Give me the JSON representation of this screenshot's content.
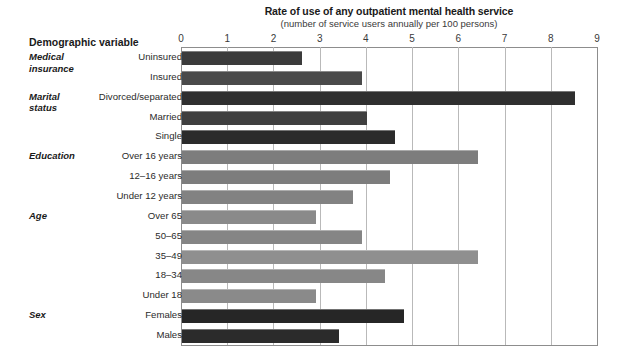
{
  "header": {
    "left_column_title": "Demographic variable",
    "chart_title": "Rate of use of any outpatient mental health service",
    "chart_subtitle": "(number of service users annually per 100 persons)"
  },
  "colors": {
    "bar_dark": "#3b3b3b",
    "bar_medium": "#7d7d7d",
    "gridline": "#b9b9b9",
    "axis": "#8d8d8d",
    "text": "#231f20"
  },
  "groups": [
    {
      "name": "Medical\ninsurance"
    },
    {
      "name": "Marital\nstatus"
    },
    {
      "name": "Education"
    },
    {
      "name": "Age"
    },
    {
      "name": "Sex"
    }
  ],
  "chart_data": {
    "type": "bar",
    "orientation": "horizontal",
    "title": "Rate of use of any outpatient mental health service",
    "subtitle": "(number of service users annually per 100 persons)",
    "xlabel": "(number of service users annually per 100 persons)",
    "ylabel": "Demographic variable",
    "xlim": [
      0,
      9
    ],
    "xticks": [
      0,
      1,
      2,
      3,
      4,
      5,
      6,
      7,
      8,
      9
    ],
    "xticklabels": [
      "0",
      "1",
      "2",
      "3",
      "4",
      "5",
      "6",
      "7",
      "8",
      "9"
    ],
    "grid": true,
    "legend": "none",
    "categories": [
      "Uninsured",
      "Insured",
      "Divorced/separated",
      "Married",
      "Single",
      "Over 16 years",
      "12–16 years",
      "Under 12 years",
      "Over 65",
      "50–65",
      "35–49",
      "18–34",
      "Under 18",
      "Females",
      "Males"
    ],
    "values": [
      2.6,
      3.9,
      8.5,
      4.0,
      4.6,
      6.4,
      4.5,
      3.7,
      2.9,
      3.9,
      6.4,
      4.4,
      2.9,
      4.8,
      3.4
    ],
    "group_of_category": [
      "Medical insurance",
      "Medical insurance",
      "Marital status",
      "Marital status",
      "Marital status",
      "Education",
      "Education",
      "Education",
      "Age",
      "Age",
      "Age",
      "Age",
      "Age",
      "Sex",
      "Sex"
    ],
    "bar_colors": [
      "#3b3b3b",
      "#4a4a4a",
      "#2f2f2f",
      "#3f3f3f",
      "#2b2b2b",
      "#7d7d7d",
      "#7d7d7d",
      "#828282",
      "#8a8a8a",
      "#858585",
      "#8f8f8f",
      "#878787",
      "#8a8a8a",
      "#262626",
      "#2b2b2b"
    ]
  }
}
